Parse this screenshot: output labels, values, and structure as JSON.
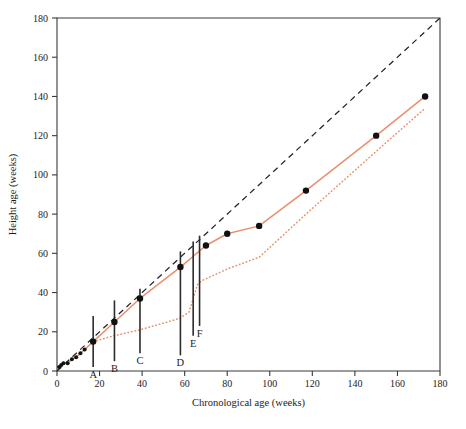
{
  "chart_data": {
    "type": "line",
    "title": "",
    "xlabel": "Chronological age (weeks)",
    "ylabel": "Height age (weeks)",
    "xlim": [
      0,
      180
    ],
    "ylim": [
      0,
      180
    ],
    "xticks": [
      0,
      20,
      40,
      60,
      80,
      100,
      120,
      140,
      160,
      180
    ],
    "yticks": [
      0,
      20,
      40,
      60,
      80,
      100,
      120,
      140,
      160,
      180
    ],
    "grid": false,
    "legend": "none",
    "series": [
      {
        "name": "identity-reference",
        "style": "dashed",
        "color": "#23232b",
        "x": [
          0,
          180
        ],
        "y": [
          0,
          180
        ]
      },
      {
        "name": "treated-growth-solid",
        "style": "solid",
        "color": "#e98f6e",
        "markers": true,
        "x": [
          1,
          2,
          3,
          5,
          7,
          9,
          11,
          13,
          17,
          27,
          39,
          58,
          70,
          80,
          95,
          117,
          150,
          173
        ],
        "y": [
          2,
          3,
          4,
          4,
          6,
          7,
          9,
          11,
          15,
          25,
          37,
          53,
          64,
          70,
          74,
          92,
          120,
          140
        ]
      },
      {
        "name": "untreated-growth-dotted",
        "style": "dotted",
        "color": "#e98f6e",
        "markers": false,
        "x": [
          17,
          27,
          39,
          52,
          58,
          62,
          64,
          66,
          68,
          80,
          95,
          117,
          150,
          173
        ],
        "y": [
          15,
          18,
          21,
          25,
          27,
          30,
          37,
          44,
          46,
          52,
          58,
          80,
          112,
          134
        ]
      }
    ],
    "annotations": [
      {
        "label": "A",
        "x": 17,
        "y_bottom": 2,
        "y_top": 28
      },
      {
        "label": "B",
        "x": 27,
        "y_bottom": 5,
        "y_top": 36
      },
      {
        "label": "C",
        "x": 39,
        "y_bottom": 9,
        "y_top": 42
      },
      {
        "label": "D",
        "x": 58,
        "y_bottom": 8,
        "y_top": 61
      },
      {
        "label": "E",
        "x": 64,
        "y_bottom": 18,
        "y_top": 66
      },
      {
        "label": "F",
        "x": 67,
        "y_bottom": 23,
        "y_top": 69
      }
    ]
  },
  "axes": {
    "x": {
      "title": "Chronological age (weeks)",
      "tick_labels": [
        "0",
        "20",
        "40",
        "60",
        "80",
        "100",
        "120",
        "140",
        "160",
        "180"
      ]
    },
    "y": {
      "title": "Height age (weeks)",
      "tick_labels": [
        "0",
        "20",
        "40",
        "60",
        "80",
        "100",
        "120",
        "140",
        "160",
        "180"
      ]
    }
  },
  "colors": {
    "series": "#e98f6e",
    "reference": "#23232b",
    "axis": "#3a3a3a",
    "marker": "#2b2b2b",
    "background": "#ffffff"
  }
}
